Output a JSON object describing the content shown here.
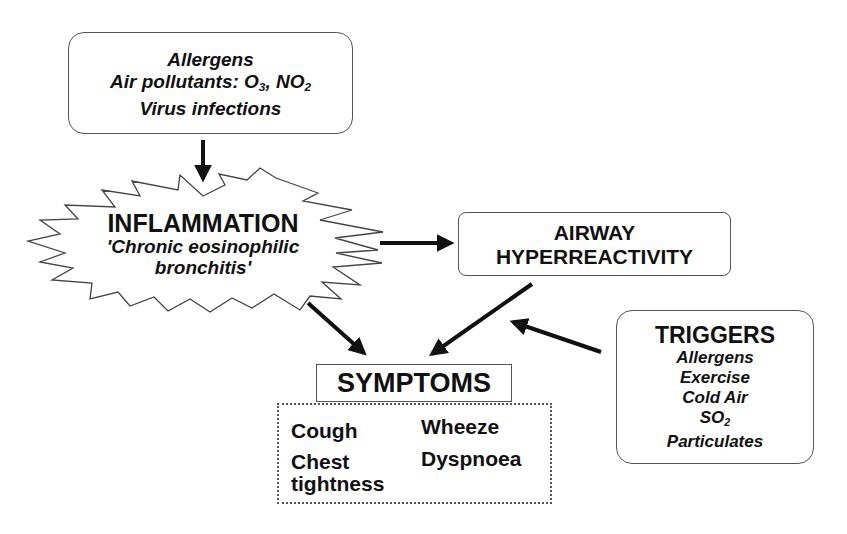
{
  "diagram": {
    "type": "flowchart",
    "topic": "Asthma pathophysiology",
    "causes": {
      "lines": [
        {
          "text": "Allergens"
        },
        {
          "text": "Air pollutants: O",
          "sub1": "3",
          "mid": ", NO",
          "sub2": "2"
        },
        {
          "text": "Virus infections"
        }
      ]
    },
    "inflammation": {
      "title": "INFLAMMATION",
      "subtitle_line1": "'Chronic eosinophilic",
      "subtitle_line2": "bronchitis'"
    },
    "airway": {
      "line1": "AIRWAY",
      "line2": "HYPERREACTIVITY"
    },
    "triggers": {
      "title": "TRIGGERS",
      "items": [
        {
          "text": "Allergens"
        },
        {
          "text": "Exercise"
        },
        {
          "text": "Cold Air"
        },
        {
          "text": "SO",
          "sub": "2"
        },
        {
          "text": "Particulates"
        }
      ]
    },
    "symptoms": {
      "title": "SYMPTOMS",
      "items": [
        "Cough",
        "Wheeze",
        "Chest",
        "tightness",
        "Dyspnoea"
      ]
    },
    "edges": [
      {
        "from": "causes",
        "to": "inflammation"
      },
      {
        "from": "inflammation",
        "to": "airway"
      },
      {
        "from": "inflammation",
        "to": "symptoms"
      },
      {
        "from": "airway",
        "to": "symptoms"
      },
      {
        "from": "triggers",
        "to": "airway-symptoms-arrow"
      }
    ]
  }
}
